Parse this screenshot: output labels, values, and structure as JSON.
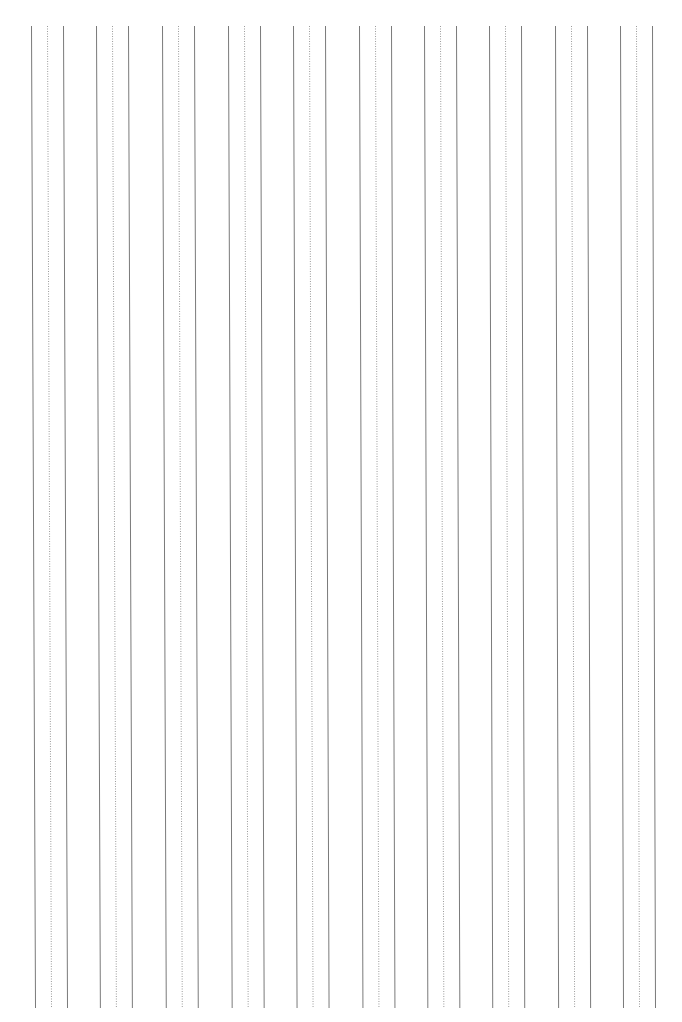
{
  "page": {
    "type": "lined-practice-sheet",
    "orientation": "vertical-lines",
    "background": "#ffffff"
  },
  "layout": {
    "group_count": 10,
    "group_starts_top": [
      31,
      96,
      162,
      228,
      293,
      359,
      424,
      489,
      555,
      620
    ],
    "group_width": 32,
    "y_top": 26,
    "y_bottom": 1008,
    "skew_left": 4,
    "skew_right": 3
  },
  "style": {
    "solid_color": "#7a7a7a",
    "dotted_color": "#9a9a9a",
    "solid_width": 1,
    "dotted_width": 1,
    "dot_pattern": "1 1.5"
  }
}
